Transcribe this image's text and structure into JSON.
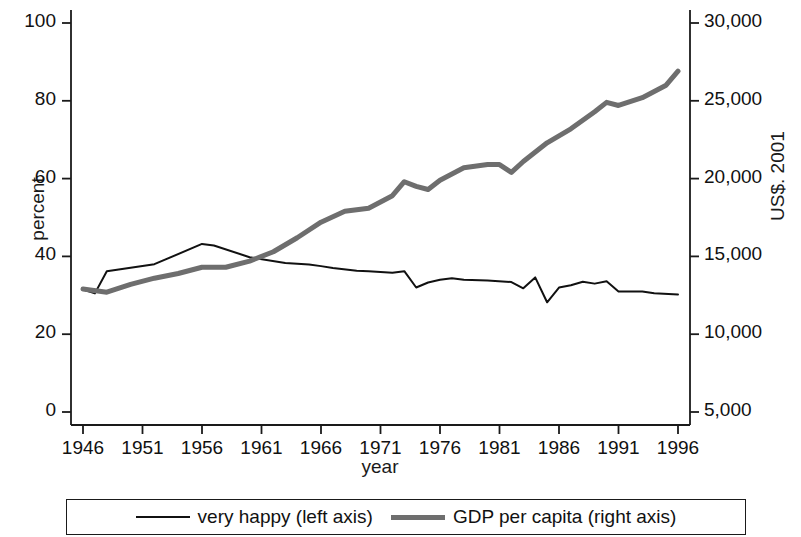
{
  "chart_data": {
    "type": "line",
    "title": "",
    "subtitle": "",
    "xlabel": "year",
    "ylabel": "percent",
    "ylabel_right": "US$. 2001",
    "grid": false,
    "legend_position": "bottom",
    "xlim": [
      1946,
      1996
    ],
    "ylim": [
      0,
      100
    ],
    "ylim_right": [
      5000,
      30000
    ],
    "xticks": [
      1946,
      1951,
      1956,
      1961,
      1966,
      1971,
      1976,
      1981,
      1986,
      1991,
      1996
    ],
    "xticklabels": [
      "1946",
      "1951",
      "1956",
      "1961",
      "1966",
      "1971",
      "1976",
      "1981",
      "1986",
      "1991",
      "1996"
    ],
    "yticks": [
      0,
      20,
      40,
      60,
      80,
      100
    ],
    "yticklabels": [
      "0",
      "20",
      "40",
      "60",
      "80",
      "100"
    ],
    "yticks_right": [
      5000,
      10000,
      15000,
      20000,
      25000,
      30000
    ],
    "yticklabels_right": [
      "5,000",
      "10,000",
      "15,000",
      "20,000",
      "25,000",
      "30,000"
    ],
    "series": [
      {
        "name": "very happy (left axis)",
        "axis": "left",
        "color": "#111111",
        "linewidth": 2.0,
        "x": [
          1946,
          1947,
          1948,
          1952,
          1956,
          1957,
          1960,
          1963,
          1965,
          1966,
          1967,
          1969,
          1970,
          1971,
          1972,
          1973,
          1974,
          1975,
          1976,
          1977,
          1978,
          1980,
          1982,
          1983,
          1984,
          1985,
          1986,
          1987,
          1988,
          1989,
          1990,
          1991,
          1993,
          1994,
          1996
        ],
        "values": [
          31.5,
          30.5,
          36.2,
          38.0,
          43.2,
          42.8,
          39.8,
          38.3,
          37.9,
          37.5,
          37.0,
          36.3,
          36.2,
          36.0,
          35.8,
          36.2,
          32.0,
          33.3,
          34.0,
          34.4,
          34.0,
          33.8,
          33.4,
          31.8,
          34.6,
          28.2,
          32.0,
          32.6,
          33.5,
          33.0,
          33.6,
          31.0,
          31.0,
          30.5,
          30.2
        ]
      },
      {
        "name": "GDP per capita (right axis)",
        "axis": "right",
        "color": "#6e6e6e",
        "linewidth": 5.0,
        "x": [
          1946,
          1948,
          1950,
          1952,
          1954,
          1956,
          1958,
          1960,
          1962,
          1964,
          1966,
          1968,
          1970,
          1972,
          1973,
          1974,
          1975,
          1976,
          1978,
          1980,
          1981,
          1982,
          1983,
          1985,
          1987,
          1989,
          1990,
          1991,
          1993,
          1995,
          1996
        ],
        "values": [
          12900,
          12700,
          13200,
          13600,
          13900,
          14300,
          14300,
          14700,
          15300,
          16200,
          17200,
          17900,
          18100,
          18900,
          19800,
          19500,
          19300,
          19900,
          20700,
          20900,
          20900,
          20400,
          21100,
          22300,
          23200,
          24300,
          24900,
          24700,
          25200,
          26000,
          26900
        ]
      }
    ],
    "legend": [
      {
        "label": "very happy (left axis)",
        "style": "thin-line",
        "color": "#111111"
      },
      {
        "label": "GDP per capita (right axis)",
        "style": "thick-line",
        "color": "#6e6e6e"
      }
    ]
  }
}
